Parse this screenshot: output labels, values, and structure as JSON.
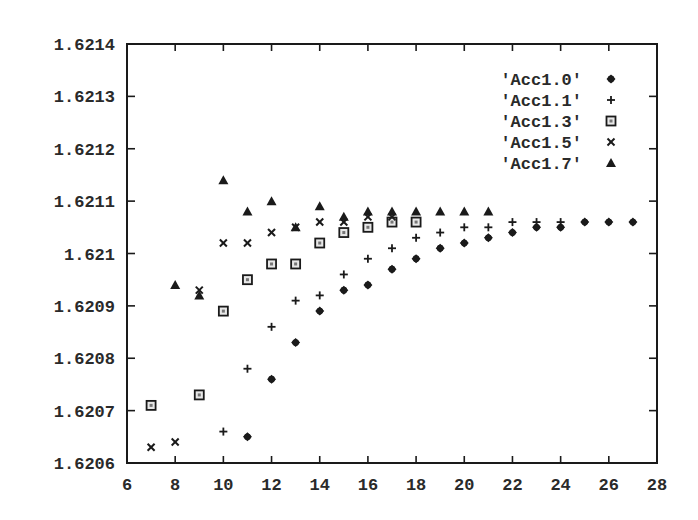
{
  "chart_data": {
    "type": "scatter",
    "title": "",
    "xlabel": "",
    "ylabel": "",
    "xlim": [
      6,
      28
    ],
    "ylim": [
      1.6206,
      1.6214
    ],
    "grid": false,
    "legend_position": "top-right",
    "x_ticks": [
      "6",
      "8",
      "10",
      "12",
      "14",
      "16",
      "18",
      "20",
      "22",
      "24",
      "26",
      "28"
    ],
    "y_ticks": [
      "1.6206",
      "1.6207",
      "1.6208",
      "1.6209",
      "1.621",
      "1.6211",
      "1.6212",
      "1.6213",
      "1.6214"
    ],
    "series": [
      {
        "name": "'Acc1.0'",
        "marker": "diamond",
        "x": [
          11,
          12,
          13,
          14,
          15,
          16,
          17,
          18,
          19,
          20,
          21,
          22,
          23,
          24,
          25,
          26,
          27
        ],
        "values": [
          1.62065,
          1.62076,
          1.62083,
          1.62089,
          1.62093,
          1.62094,
          1.62097,
          1.62099,
          1.62101,
          1.62102,
          1.62103,
          1.62104,
          1.62105,
          1.62105,
          1.62106,
          1.62106,
          1.62106
        ]
      },
      {
        "name": "'Acc1.1'",
        "marker": "plus",
        "x": [
          10,
          11,
          12,
          13,
          14,
          15,
          16,
          17,
          18,
          19,
          20,
          21,
          22,
          23,
          24
        ],
        "values": [
          1.62066,
          1.62078,
          1.62086,
          1.62091,
          1.62092,
          1.62096,
          1.62099,
          1.62101,
          1.62103,
          1.62104,
          1.62105,
          1.62105,
          1.62106,
          1.62106,
          1.62106
        ]
      },
      {
        "name": "'Acc1.3'",
        "marker": "square",
        "x": [
          7,
          9,
          10,
          11,
          12,
          13,
          14,
          15,
          16,
          17,
          18
        ],
        "values": [
          1.62071,
          1.62073,
          1.62089,
          1.62095,
          1.62098,
          1.62098,
          1.62102,
          1.62104,
          1.62105,
          1.62106,
          1.62106
        ]
      },
      {
        "name": "'Acc1.5'",
        "marker": "cross",
        "x": [
          7,
          8,
          9,
          10,
          11,
          12,
          13,
          14,
          15,
          16,
          17
        ],
        "values": [
          1.62063,
          1.62064,
          1.62093,
          1.62102,
          1.62102,
          1.62104,
          1.62105,
          1.62106,
          1.62106,
          1.62107,
          1.62107
        ]
      },
      {
        "name": "'Acc1.7'",
        "marker": "triangle",
        "x": [
          8,
          9,
          10,
          11,
          12,
          13,
          14,
          15,
          16,
          17,
          18,
          19,
          20,
          21
        ],
        "values": [
          1.62094,
          1.62092,
          1.62114,
          1.62108,
          1.6211,
          1.62105,
          1.62109,
          1.62107,
          1.62108,
          1.62108,
          1.62108,
          1.62108,
          1.62108,
          1.62108
        ]
      }
    ]
  },
  "colors": {
    "ink": "#1a1a1a",
    "background": "#ffffff"
  }
}
